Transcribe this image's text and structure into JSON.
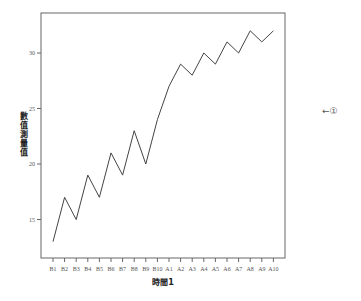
{
  "chart_data": {
    "type": "line",
    "title": "",
    "xlabel": "時間1",
    "ylabel": "數值測量值",
    "categories": [
      "B1",
      "B2",
      "B3",
      "B4",
      "B5",
      "B6",
      "B7",
      "B8",
      "B9",
      "B10",
      "A1",
      "A2",
      "A3",
      "A4",
      "A5",
      "A6",
      "A7",
      "A8",
      "A9",
      "A10"
    ],
    "series": [
      {
        "name": "數值測量值",
        "values": [
          13,
          17,
          15,
          19,
          17,
          21,
          19,
          23,
          20,
          24,
          27,
          29,
          28,
          30,
          29,
          31,
          30,
          32,
          31,
          32
        ]
      }
    ],
    "yticks": [
      15,
      20,
      25,
      30
    ],
    "ylim": [
      12.5,
      34.2
    ],
    "grid": false,
    "legend": null,
    "annotations": [
      "←①"
    ]
  },
  "annotation": "←①"
}
